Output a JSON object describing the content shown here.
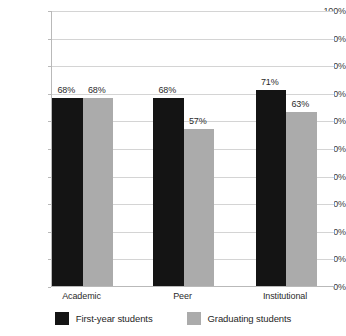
{
  "chart_data": {
    "type": "bar",
    "title": "",
    "subtitle": "",
    "xlabel": "",
    "ylabel": "",
    "categories": [
      "Academic",
      "Peer",
      "Institutional"
    ],
    "series": [
      {
        "name": "First-year students",
        "color": "#141414",
        "values": [
          68,
          68,
          71
        ],
        "labels": [
          "68%",
          "68%",
          "71%"
        ]
      },
      {
        "name": "Graduating students",
        "color": "#ababab",
        "values": [
          68,
          57,
          63
        ],
        "labels": [
          "68%",
          "57%",
          "63%"
        ]
      }
    ],
    "ylim": [
      0,
      100
    ],
    "y_tick_values": [
      100,
      90,
      80,
      70,
      60,
      50,
      40,
      30,
      20,
      10,
      0
    ],
    "y_tick_labels": [
      "100%",
      "90%",
      "80%",
      "70%",
      "60%",
      "50%",
      "40%",
      "30%",
      "20%",
      "10%",
      "0%"
    ],
    "grid": true,
    "grid_color": "#d4d4d4",
    "axis_color": "#b9b9b9",
    "legend_position": "bottom",
    "background": "#ffffff",
    "value_labels_shown": true
  }
}
